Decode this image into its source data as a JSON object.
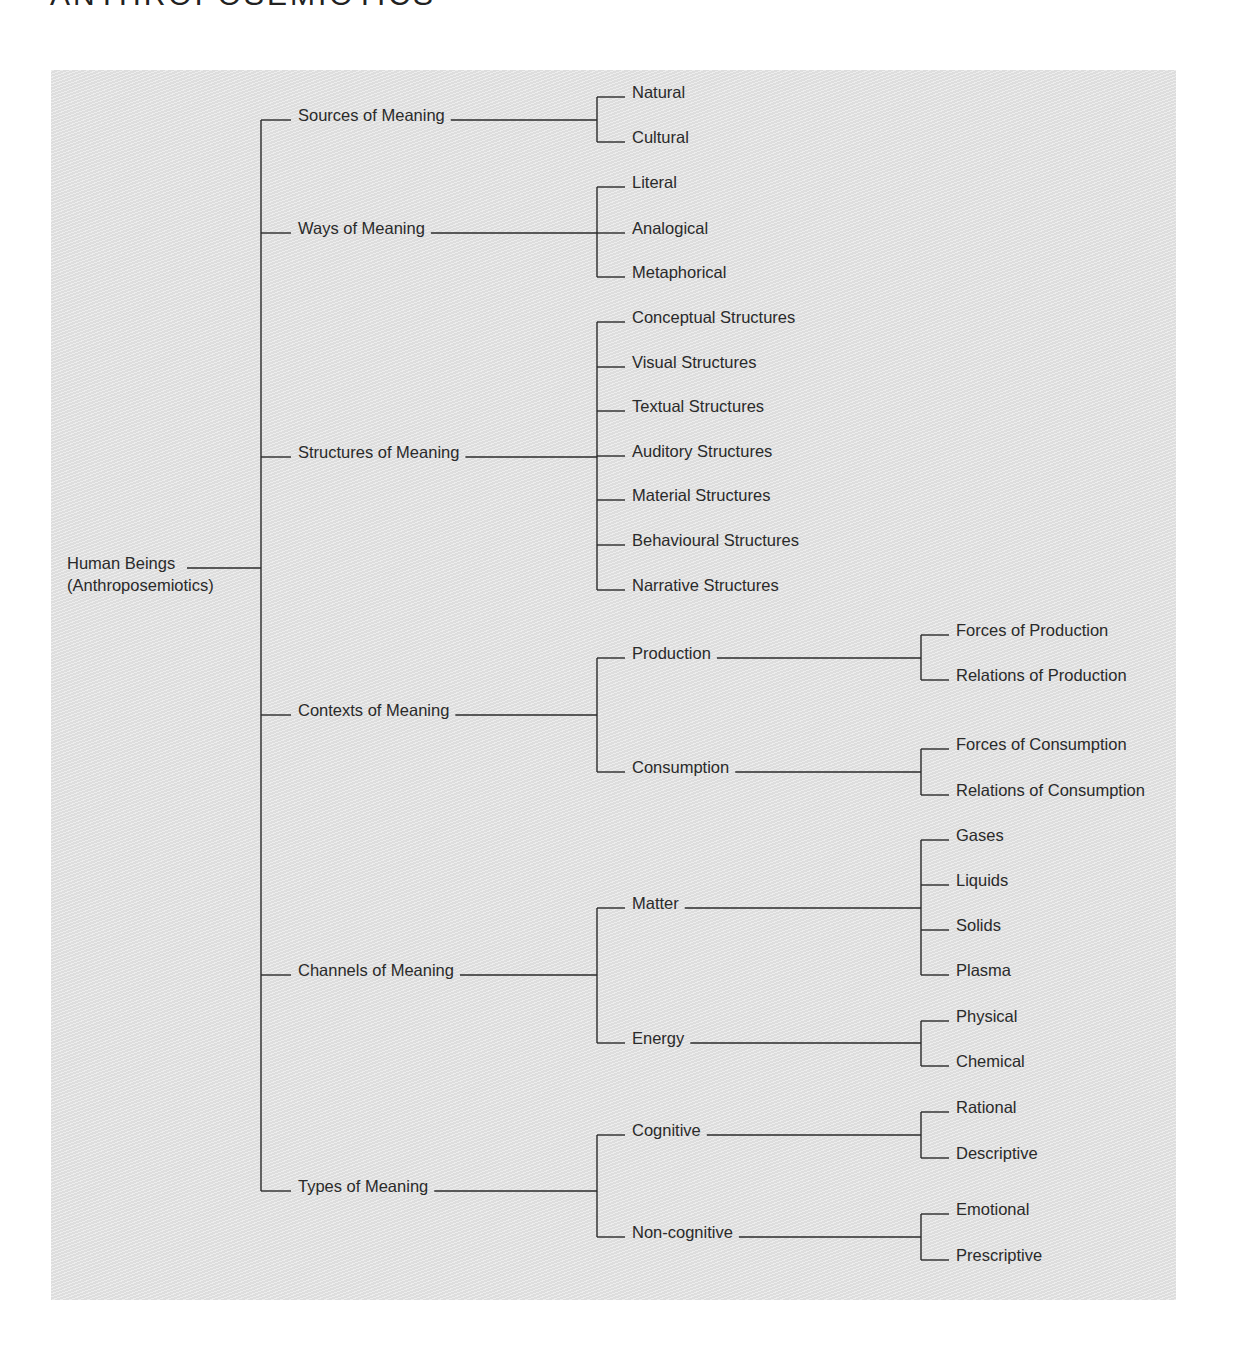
{
  "title": "ANTHROPOSEMIOTICS",
  "colors": {
    "line": "#2a2a2a",
    "panel_bg": "#e4e4e4",
    "text": "#2a2a2a"
  },
  "root": {
    "label_line1": "Human Beings",
    "label_line2": "(Anthroposemiotics)"
  },
  "tree": [
    {
      "label": "Sources of Meaning",
      "children": [
        {
          "label": "Natural"
        },
        {
          "label": "Cultural"
        }
      ]
    },
    {
      "label": "Ways of Meaning",
      "children": [
        {
          "label": "Literal"
        },
        {
          "label": "Analogical"
        },
        {
          "label": "Metaphorical"
        }
      ]
    },
    {
      "label": "Structures of Meaning",
      "children": [
        {
          "label": "Conceptual Structures"
        },
        {
          "label": "Visual Structures"
        },
        {
          "label": "Textual Structures"
        },
        {
          "label": "Auditory Structures"
        },
        {
          "label": "Material Structures"
        },
        {
          "label": "Behavioural Structures"
        },
        {
          "label": "Narrative Structures"
        }
      ]
    },
    {
      "label": "Contexts of Meaning",
      "children": [
        {
          "label": "Production",
          "children": [
            {
              "label": "Forces of Production"
            },
            {
              "label": "Relations of Production"
            }
          ]
        },
        {
          "label": "Consumption",
          "children": [
            {
              "label": "Forces of Consumption"
            },
            {
              "label": "Relations of Consumption"
            }
          ]
        }
      ]
    },
    {
      "label": "Channels of Meaning",
      "children": [
        {
          "label": "Matter",
          "children": [
            {
              "label": "Gases"
            },
            {
              "label": "Liquids"
            },
            {
              "label": "Solids"
            },
            {
              "label": "Plasma"
            }
          ]
        },
        {
          "label": "Energy",
          "children": [
            {
              "label": "Physical"
            },
            {
              "label": "Chemical"
            }
          ]
        }
      ]
    },
    {
      "label": "Types of Meaning",
      "children": [
        {
          "label": "Cognitive",
          "children": [
            {
              "label": "Rational"
            },
            {
              "label": "Descriptive"
            }
          ]
        },
        {
          "label": "Non-cognitive",
          "children": [
            {
              "label": "Emotional"
            },
            {
              "label": "Prescriptive"
            }
          ]
        }
      ]
    }
  ]
}
